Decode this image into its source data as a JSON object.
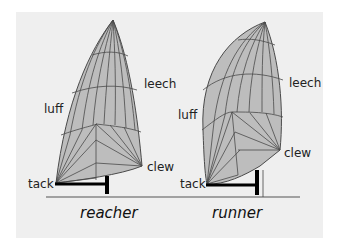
{
  "diagram": {
    "colors": {
      "background": "#efefef",
      "sail_fill": "#bdbdbd",
      "sail_line": "#4a4a4a",
      "pole": "#000000",
      "deck_line": "#555555"
    },
    "sails": [
      {
        "name": "reacher",
        "caption": "reacher",
        "labels": {
          "luff": "luff",
          "leech": "leech",
          "clew": "clew",
          "tack": "tack"
        }
      },
      {
        "name": "runner",
        "caption": "runner",
        "labels": {
          "luff": "luff",
          "leech": "leech",
          "clew": "clew",
          "tack": "tack"
        }
      }
    ]
  }
}
